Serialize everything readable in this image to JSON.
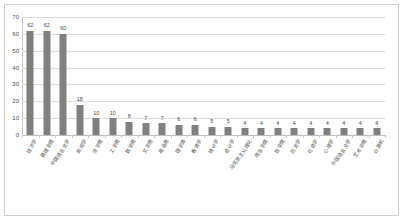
{
  "chart_data": {
    "type": "bar",
    "title": "",
    "subtitle": "",
    "xlabel": "",
    "ylabel": "",
    "ylim": [
      0,
      70
    ],
    "ytick_step": 10,
    "yticks": [
      0,
      10,
      20,
      30,
      40,
      50,
      60,
      70
    ],
    "grid": true,
    "legend": "none",
    "bar_color": "#808080",
    "gridline_color": "#dcdcdc",
    "label_rotation_deg": -55,
    "categories": [
      "经济学",
      "管理学类",
      "中国语言文学",
      "新闻学",
      "法学类",
      "工学类",
      "数学类",
      "文学类",
      "英语类",
      "理学类",
      "教育学",
      "统计学",
      "会计学",
      "马克思主义理论",
      "政治学类",
      "哲学类",
      "历史学",
      "社会学",
      "心理学",
      "外国语言文学",
      "艺术学类",
      "计算机"
    ],
    "values": [
      62,
      62,
      60,
      18,
      10,
      10,
      8,
      7,
      7,
      6,
      6,
      5,
      5,
      4,
      4,
      4,
      4,
      4,
      4,
      4,
      4,
      4
    ],
    "value_labels": [
      "62",
      "62",
      "60",
      "18",
      "10",
      "10",
      "8",
      "7",
      "7",
      "6",
      "6",
      "5",
      "5",
      "4",
      "4",
      "4",
      "4",
      "4",
      "4",
      "4",
      "4",
      "4"
    ]
  }
}
